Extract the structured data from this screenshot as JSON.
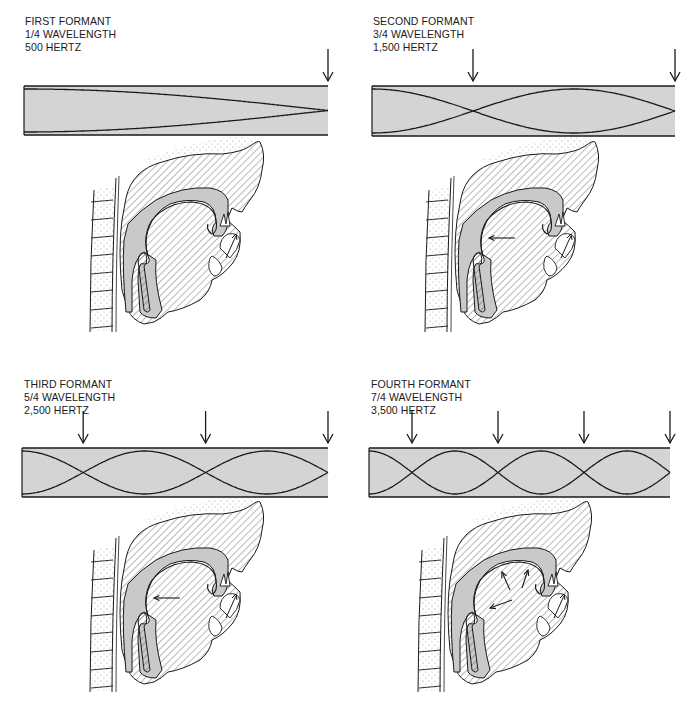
{
  "panels": [
    {
      "id": "first",
      "caption": [
        "FIRST FORMANT",
        "1/4 WAVELENGTH",
        "500 HERTZ"
      ],
      "formant": "First formant",
      "wavelength_fraction": "1/4",
      "frequency_hz": 500,
      "quarter_waves": 1,
      "node_arrows": 1,
      "tract_arrows": 0
    },
    {
      "id": "second",
      "caption": [
        "SECOND FORMANT",
        "3/4 WAVELENGTH",
        "1,500 HERTZ"
      ],
      "formant": "Second formant",
      "wavelength_fraction": "3/4",
      "frequency_hz": 1500,
      "quarter_waves": 3,
      "node_arrows": 2,
      "tract_arrows": 1
    },
    {
      "id": "third",
      "caption": [
        "THIRD FORMANT",
        "5/4 WAVELENGTH",
        "2,500 HERTZ"
      ],
      "formant": "Third formant",
      "wavelength_fraction": "5/4",
      "frequency_hz": 2500,
      "quarter_waves": 5,
      "node_arrows": 3,
      "tract_arrows": 1
    },
    {
      "id": "fourth",
      "caption": [
        "FOURTH FORMANT",
        "7/4 WAVELENGTH",
        "3,500 HERTZ"
      ],
      "formant": "Fourth formant",
      "wavelength_fraction": "7/4",
      "frequency_hz": 3500,
      "quarter_waves": 7,
      "node_arrows": 4,
      "tract_arrows": 3
    }
  ],
  "colors": {
    "tube_fill": "#d4d4d4",
    "tract_fill": "#c9c9c9",
    "line": "#1a1a1a",
    "background": "#ffffff"
  }
}
